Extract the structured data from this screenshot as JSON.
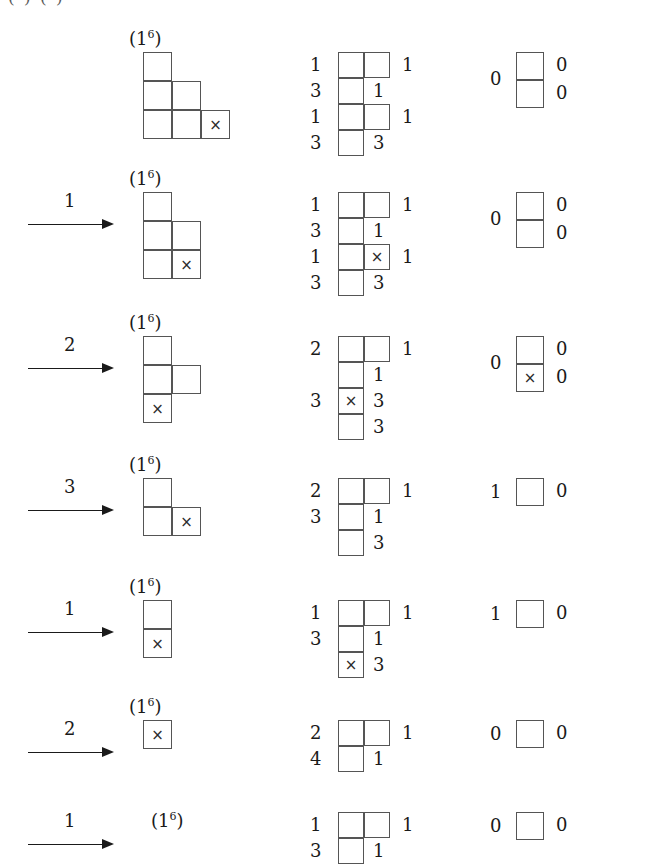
{
  "top_cut_text": "( ) ( )",
  "glyphs": {
    "x_mark": "×",
    "partition_base": "(1",
    "partition_exp": "6",
    "partition_close": ")"
  },
  "colors": {
    "background": "#ffffff",
    "cell_border": "#555555",
    "text": "#1a1a1a",
    "x_mark": "#2b2b2b"
  },
  "rows": [
    {
      "id": "row-1",
      "arrow": null,
      "partition_label": "(1⁶)",
      "young": {
        "rows": [
          1,
          2,
          3
        ],
        "x_cell": {
          "row": 3,
          "col": 3
        }
      },
      "middle": {
        "left_labels": [
          "1",
          "3",
          "1",
          "3"
        ],
        "right_labels": [
          "1",
          "",
          "1",
          ""
        ],
        "inner_labels": [
          "",
          "1",
          "",
          "3"
        ],
        "left_col_cells": [
          1,
          2,
          3,
          4
        ],
        "right_col_cells": [
          1,
          3
        ],
        "x_cell": null
      },
      "right": {
        "left_label": "0",
        "right_labels": [
          "0",
          "0"
        ],
        "cells": 2,
        "x_cell": null
      }
    },
    {
      "id": "row-2",
      "arrow": "1",
      "partition_label": "(1⁶)",
      "young": {
        "rows": [
          1,
          2,
          2
        ],
        "x_cell": {
          "row": 3,
          "col": 2
        }
      },
      "middle": {
        "left_labels": [
          "1",
          "3",
          "1",
          "3"
        ],
        "right_labels": [
          "1",
          "",
          "1",
          ""
        ],
        "inner_labels": [
          "",
          "1",
          "",
          "3"
        ],
        "left_col_cells": [
          1,
          2,
          3,
          4
        ],
        "right_col_cells": [
          1,
          3
        ],
        "x_cell": {
          "row": 3,
          "col": 2
        }
      },
      "right": {
        "left_label": "0",
        "right_labels": [
          "0",
          "0"
        ],
        "cells": 2,
        "x_cell": null
      }
    },
    {
      "id": "row-3",
      "arrow": "2",
      "partition_label": "(1⁶)",
      "young": {
        "rows": [
          1,
          2,
          1
        ],
        "x_cell": {
          "row": 3,
          "col": 1
        }
      },
      "middle": {
        "left_labels": [
          "2",
          "",
          "3",
          ""
        ],
        "right_labels": [
          "1",
          "",
          "",
          ""
        ],
        "inner_labels": [
          "",
          "1",
          "3",
          "3"
        ],
        "left_col_cells": [
          1,
          2,
          3,
          4
        ],
        "right_col_cells": [
          1
        ],
        "x_cell": {
          "row": 3,
          "col": 1
        }
      },
      "right": {
        "left_label": "0",
        "right_labels": [
          "0",
          "0"
        ],
        "cells": 2,
        "x_cell": {
          "row": 2
        }
      }
    },
    {
      "id": "row-4",
      "arrow": "3",
      "partition_label": "(1⁶)",
      "young": {
        "rows": [
          1,
          2
        ],
        "x_cell": {
          "row": 2,
          "col": 2
        }
      },
      "middle": {
        "left_labels": [
          "2",
          "3",
          "",
          ""
        ],
        "right_labels": [
          "1",
          "",
          "",
          ""
        ],
        "inner_labels": [
          "",
          "1",
          "3",
          ""
        ],
        "left_col_cells": [
          1,
          2,
          3
        ],
        "right_col_cells": [
          1
        ],
        "x_cell": null
      },
      "right": {
        "left_label": "1",
        "right_labels": [
          "0"
        ],
        "cells": 1,
        "x_cell": null
      }
    },
    {
      "id": "row-5",
      "arrow": "1",
      "partition_label": "(1⁶)",
      "young": {
        "rows": [
          1,
          1
        ],
        "x_cell": {
          "row": 2,
          "col": 1
        }
      },
      "middle": {
        "left_labels": [
          "1",
          "3",
          "",
          ""
        ],
        "right_labels": [
          "1",
          "",
          "",
          ""
        ],
        "inner_labels": [
          "",
          "1",
          "3",
          ""
        ],
        "left_col_cells": [
          1,
          2,
          3
        ],
        "right_col_cells": [
          1
        ],
        "x_cell": {
          "row": 3,
          "col": 1
        }
      },
      "right": {
        "left_label": "1",
        "right_labels": [
          "0"
        ],
        "cells": 1,
        "x_cell": null
      }
    },
    {
      "id": "row-6",
      "arrow": "2",
      "partition_label": "(1⁶)",
      "young": {
        "rows": [
          1
        ],
        "x_cell": {
          "row": 1,
          "col": 1
        }
      },
      "middle": {
        "left_labels": [
          "2",
          "4",
          "",
          ""
        ],
        "right_labels": [
          "1",
          "",
          "",
          ""
        ],
        "inner_labels": [
          "",
          "1",
          "",
          ""
        ],
        "left_col_cells": [
          1,
          2
        ],
        "right_col_cells": [
          1
        ],
        "x_cell": null
      },
      "right": {
        "left_label": "0",
        "right_labels": [
          "0"
        ],
        "cells": 1,
        "x_cell": null
      }
    },
    {
      "id": "row-7",
      "arrow": "1",
      "partition_label": "(1⁶)",
      "young": {
        "rows": [],
        "x_cell": null
      },
      "middle": {
        "left_labels": [
          "1",
          "3",
          "",
          ""
        ],
        "right_labels": [
          "1",
          "",
          "",
          ""
        ],
        "inner_labels": [
          "",
          "1",
          "",
          ""
        ],
        "left_col_cells": [
          1,
          2
        ],
        "right_col_cells": [
          1
        ],
        "x_cell": null
      },
      "right": {
        "left_label": "0",
        "right_labels": [
          "0"
        ],
        "cells": 1,
        "x_cell": null
      }
    }
  ]
}
